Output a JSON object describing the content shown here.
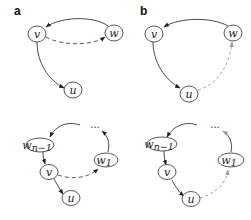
{
  "panels": [
    {
      "label": "a",
      "top": {
        "nodes": {
          "v": "v",
          "w": "w",
          "u": "u"
        },
        "edges": [
          {
            "from": "w",
            "to": "v",
            "style": "solid"
          },
          {
            "from": "v",
            "to": "w",
            "style": "dashed"
          },
          {
            "from": "v",
            "to": "u",
            "style": "solid"
          }
        ]
      },
      "bottom": {
        "nodes": {
          "w_n_minus_1": "w",
          "w_n_minus_1_sub": "n−1",
          "v": "v",
          "u": "u",
          "w_1": "w",
          "w_1_sub": "1",
          "ellipsis": "..."
        },
        "edges": [
          {
            "from": "ellipsis",
            "to": "w_n-1",
            "style": "solid"
          },
          {
            "from": "w_n-1",
            "to": "v",
            "style": "solid"
          },
          {
            "from": "v",
            "to": "u",
            "style": "solid"
          },
          {
            "from": "v",
            "to": "w_1",
            "style": "dashed"
          },
          {
            "from": "w_1",
            "to": "ellipsis",
            "style": "solid"
          }
        ]
      }
    },
    {
      "label": "b",
      "top": {
        "nodes": {
          "v": "v",
          "w": "w",
          "u": "u"
        },
        "edges": [
          {
            "from": "w",
            "to": "v",
            "style": "solid"
          },
          {
            "from": "v",
            "to": "u",
            "style": "solid"
          },
          {
            "from": "u",
            "to": "w",
            "style": "dashed-gray"
          }
        ]
      },
      "bottom": {
        "nodes": {
          "w_n_minus_1": "w",
          "w_n_minus_1_sub": "n−1",
          "v": "v",
          "u": "u",
          "w_1": "w",
          "w_1_sub": "1",
          "ellipsis": "..."
        },
        "edges": [
          {
            "from": "ellipsis",
            "to": "w_n-1",
            "style": "solid"
          },
          {
            "from": "w_n-1",
            "to": "v",
            "style": "solid"
          },
          {
            "from": "v",
            "to": "u",
            "style": "solid"
          },
          {
            "from": "u",
            "to": "w_1",
            "style": "dashed-gray"
          },
          {
            "from": "w_1",
            "to": "ellipsis",
            "style": "solid"
          }
        ]
      }
    }
  ]
}
